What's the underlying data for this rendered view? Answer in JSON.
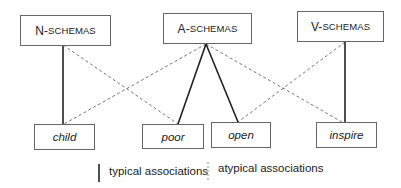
{
  "schemas": [
    {
      "id": "n",
      "prefix": "N-",
      "rest": "SCHEMAS",
      "label": "N-SCHEMAS"
    },
    {
      "id": "a",
      "prefix": "A-",
      "rest": "SCHEMAS",
      "label": "A-SCHEMAS"
    },
    {
      "id": "v",
      "prefix": "V-",
      "rest": "SCHEMAS",
      "label": "V-SCHEMAS"
    }
  ],
  "words": [
    {
      "id": "child",
      "label": "child"
    },
    {
      "id": "poor",
      "label": "poor"
    },
    {
      "id": "open",
      "label": "open"
    },
    {
      "id": "inspire",
      "label": "inspire"
    }
  ],
  "associations": {
    "typical": [
      {
        "from": "N-SCHEMAS",
        "to": "child"
      },
      {
        "from": "A-SCHEMAS",
        "to": "poor"
      },
      {
        "from": "A-SCHEMAS",
        "to": "open"
      },
      {
        "from": "V-SCHEMAS",
        "to": "inspire"
      }
    ],
    "atypical": [
      {
        "from": "N-SCHEMAS",
        "to": "poor"
      },
      {
        "from": "A-SCHEMAS",
        "to": "child"
      },
      {
        "from": "A-SCHEMAS",
        "to": "inspire"
      },
      {
        "from": "V-SCHEMAS",
        "to": "open"
      }
    ]
  },
  "legend": {
    "typical_label": "typical associations",
    "atypical_label": "atypical associations"
  },
  "colors": {
    "solid_line": "#222222",
    "dashed_line": "#777777",
    "box_border": "#666666"
  }
}
